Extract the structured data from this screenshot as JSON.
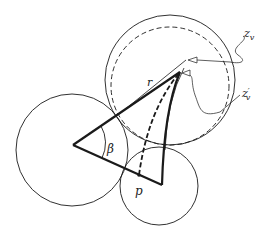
{
  "diagram": {
    "labels": {
      "r": "r",
      "beta": "β",
      "p": "p",
      "zv": "z",
      "zv_sub": "v",
      "zvp": "z",
      "zvp_sub": "v",
      "zvp_prime": "′"
    },
    "circles": [
      {
        "name": "upper-right-circle",
        "cx": 170,
        "cy": 80,
        "r": 65,
        "style": "solid"
      },
      {
        "name": "dashed-circle",
        "cx": 170,
        "cy": 86,
        "r": 59,
        "style": "dashed"
      },
      {
        "name": "left-circle",
        "cx": 72,
        "cy": 150,
        "r": 56,
        "style": "solid"
      },
      {
        "name": "bottom-circle",
        "cx": 159,
        "cy": 186,
        "r": 39,
        "style": "solid"
      }
    ],
    "triangle": {
      "left": [
        73,
        145
      ],
      "apex": [
        180,
        72
      ],
      "bottom": [
        162,
        185
      ]
    },
    "point_p": [
      139,
      175
    ],
    "stroke_color": "#1a1a1a"
  }
}
